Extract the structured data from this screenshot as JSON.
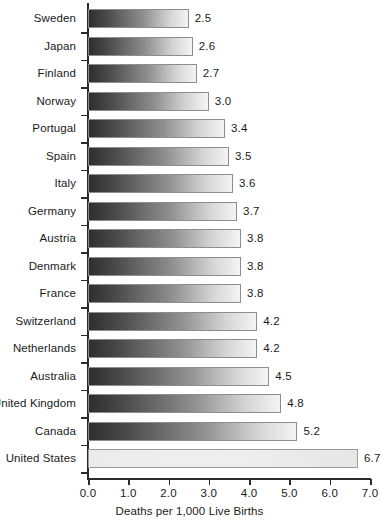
{
  "chart_data": {
    "type": "bar",
    "orientation": "horizontal",
    "title": "",
    "subtitle": "",
    "xlabel": "Deaths per 1,000 Live Births",
    "ylabel": "",
    "xlim": [
      0.0,
      7.0
    ],
    "xticks": [
      "0.0",
      "1.0",
      "2.0",
      "3.0",
      "4.0",
      "5.0",
      "6.0",
      "7.0"
    ],
    "xtick_values": [
      0.0,
      1.0,
      2.0,
      3.0,
      4.0,
      5.0,
      6.0,
      7.0
    ],
    "grid": false,
    "legend": null,
    "categories": [
      "Sweden",
      "Japan",
      "Finland",
      "Norway",
      "Portugal",
      "Spain",
      "Italy",
      "Germany",
      "Austria",
      "Denmark",
      "France",
      "Switzerland",
      "Netherlands",
      "Australia",
      "United Kingdom",
      "Canada",
      "United States"
    ],
    "values": [
      2.5,
      2.6,
      2.7,
      3.0,
      3.4,
      3.5,
      3.6,
      3.7,
      3.8,
      3.8,
      3.8,
      4.2,
      4.2,
      4.5,
      4.8,
      5.2,
      6.7
    ],
    "value_labels": [
      "2.5",
      "2.6",
      "2.7",
      "3.0",
      "3.4",
      "3.5",
      "3.6",
      "3.7",
      "3.8",
      "3.8",
      "3.8",
      "4.2",
      "4.2",
      "4.5",
      "4.8",
      "5.2",
      "6.7"
    ],
    "highlight_category": "United States",
    "colors": {
      "bar_gradient_start": "#2e2e2e",
      "bar_gradient_end": "#f4f4f4",
      "bar_border": "#8d8d8d",
      "highlight_fill": "#ebebeb",
      "axis": "#2b2b2b",
      "text": "#1a1a1a",
      "background": "#ffffff"
    }
  }
}
